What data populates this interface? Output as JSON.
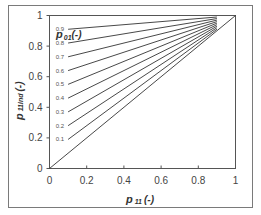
{
  "chart_data": {
    "type": "line",
    "title": "",
    "xlabel": "p 11 (-)",
    "xlabel_parts": {
      "main": "p",
      "sub": "11",
      "unit": "(-)"
    },
    "ylabel": "p 11ind (-)",
    "ylabel_parts": {
      "main": "p",
      "sub": "11ind",
      "unit": "(-)"
    },
    "legend_title": "p 01(-)",
    "legend_title_parts": {
      "main": "p",
      "sub": "01",
      "unit": "(-)"
    },
    "xlim": [
      0,
      1
    ],
    "ylim": [
      0,
      1
    ],
    "x_ticks": [
      "0",
      "0.2",
      "0.4",
      "0.6",
      "0.8",
      "1"
    ],
    "x_tick_values": [
      0,
      0.2,
      0.4,
      0.6,
      0.8,
      1
    ],
    "y_ticks": [
      "0",
      "0.2",
      "0.4",
      "0.6",
      "0.8",
      "1"
    ],
    "y_tick_values": [
      0,
      0.2,
      0.4,
      0.6,
      0.8,
      1
    ],
    "grid": false,
    "reference_line": {
      "name": "1:1",
      "x": [
        0,
        1
      ],
      "y": [
        0,
        1
      ]
    },
    "series": [
      {
        "name": "0.1",
        "p01": 0.1,
        "x": [
          0.1,
          0.9
        ],
        "y": [
          0.19,
          0.91
        ]
      },
      {
        "name": "0.2",
        "p01": 0.2,
        "x": [
          0.1,
          0.9
        ],
        "y": [
          0.28,
          0.92
        ]
      },
      {
        "name": "0.3",
        "p01": 0.3,
        "x": [
          0.1,
          0.9
        ],
        "y": [
          0.37,
          0.93
        ]
      },
      {
        "name": "0.4",
        "p01": 0.4,
        "x": [
          0.1,
          0.9
        ],
        "y": [
          0.46,
          0.94
        ]
      },
      {
        "name": "0.5",
        "p01": 0.5,
        "x": [
          0.1,
          0.9
        ],
        "y": [
          0.55,
          0.95
        ]
      },
      {
        "name": "0.6",
        "p01": 0.6,
        "x": [
          0.1,
          0.9
        ],
        "y": [
          0.64,
          0.96
        ]
      },
      {
        "name": "0.7",
        "p01": 0.7,
        "x": [
          0.1,
          0.9
        ],
        "y": [
          0.73,
          0.97
        ]
      },
      {
        "name": "0.8",
        "p01": 0.8,
        "x": [
          0.1,
          0.9
        ],
        "y": [
          0.82,
          0.98
        ]
      },
      {
        "name": "0.9",
        "p01": 0.9,
        "x": [
          0.1,
          0.9
        ],
        "y": [
          0.91,
          0.99
        ]
      }
    ]
  }
}
